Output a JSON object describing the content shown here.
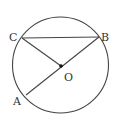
{
  "diagram": {
    "type": "geometry-circle",
    "circle": {
      "cx": 60.5,
      "cy": 65,
      "r": 48,
      "stroke": "#444444"
    },
    "points": {
      "A": {
        "label": "A",
        "x": 26,
        "y": 95
      },
      "B": {
        "label": "B",
        "x": 99,
        "y": 37
      },
      "C": {
        "label": "C",
        "x": 22,
        "y": 38
      },
      "O": {
        "label": "O",
        "x": 61,
        "y": 66
      }
    },
    "segments": [
      {
        "from": "C",
        "to": "B"
      },
      {
        "from": "C",
        "to": "O"
      },
      {
        "from": "A",
        "to": "B"
      }
    ],
    "labels": {
      "A": "A",
      "B": "B",
      "C": "C",
      "O": "O"
    }
  }
}
